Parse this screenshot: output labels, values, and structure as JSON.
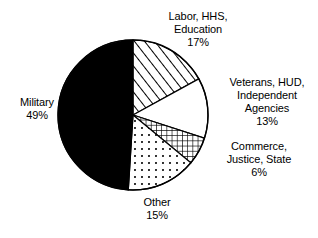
{
  "chart_data": {
    "type": "pie",
    "title": "",
    "categories": [
      "Labor, HHS, Education",
      "Veterans, HUD, Independent Agencies",
      "Commerce, Justice, State",
      "Other",
      "Military"
    ],
    "values": [
      17,
      13,
      6,
      15,
      49
    ],
    "value_unit": "%",
    "start_angle_deg": 0,
    "direction": "clockwise",
    "legend_position": "none",
    "grid": false,
    "slices": [
      {
        "key": "labor",
        "label_lines": [
          "Labor, HHS,",
          "Education"
        ],
        "value": 17,
        "value_text": "17%",
        "fill_pattern": "diagonal-hatch",
        "fill_color": "#ffffff",
        "stroke_color": "#000000",
        "start_deg": 0,
        "end_deg": 61.2
      },
      {
        "key": "veterans",
        "label_lines": [
          "Veterans, HUD,",
          "Independent",
          "Agencies"
        ],
        "value": 13,
        "value_text": "13%",
        "fill_pattern": "solid-white",
        "fill_color": "#ffffff",
        "stroke_color": "#000000",
        "start_deg": 61.2,
        "end_deg": 108.0
      },
      {
        "key": "commerce",
        "label_lines": [
          "Commerce,",
          "Justice, State"
        ],
        "value": 6,
        "value_text": "6%",
        "fill_pattern": "cross-hatch",
        "fill_color": "#ffffff",
        "stroke_color": "#000000",
        "start_deg": 108.0,
        "end_deg": 129.6
      },
      {
        "key": "other",
        "label_lines": [
          "Other"
        ],
        "value": 15,
        "value_text": "15%",
        "fill_pattern": "dotted",
        "fill_color": "#ffffff",
        "stroke_color": "#000000",
        "start_deg": 129.6,
        "end_deg": 183.6
      },
      {
        "key": "military",
        "label_lines": [
          "Military"
        ],
        "value": 49,
        "value_text": "49%",
        "fill_pattern": "solid-black",
        "fill_color": "#000000",
        "stroke_color": "#000000",
        "start_deg": 183.6,
        "end_deg": 360.0
      }
    ]
  },
  "labels": {
    "labor": {
      "line1": "Labor, HHS,",
      "line2": "Education",
      "pct": "17%"
    },
    "veterans": {
      "line1": "Veterans, HUD,",
      "line2": "Independent",
      "line3": "Agencies",
      "pct": "13%"
    },
    "commerce": {
      "line1": "Commerce,",
      "line2": "Justice, State",
      "pct": "6%"
    },
    "other": {
      "line1": "Other",
      "pct": "15%"
    },
    "military": {
      "line1": "Military",
      "pct": "49%"
    }
  }
}
